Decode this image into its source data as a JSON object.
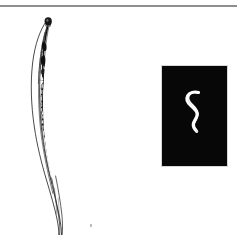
{
  "figure": {
    "title": "Nematode figure plate",
    "background_color": "#ffffff",
    "rule_color": "#8e8e8e",
    "panels": [
      {
        "id": "line-drawing",
        "kind": "line-drawing",
        "subject": "nematode whole mount, lateral view",
        "description": "Ink line drawing of an elongate nematode with a rounded darkened head bulb at the top, a broad mid-body containing stippled internal organs (pharynx, intestine, gonad), and a long tapering tail curving to the right",
        "ink_color": "#1a1a1a",
        "fill_color": "#ffffff",
        "orientation": "vertical",
        "head_position": "top",
        "tail_position": "bottom"
      },
      {
        "id": "darkfield-photo",
        "kind": "photomicrograph",
        "subject": "nematode, dark-field illumination",
        "description": "Small bright white S-shaped worm on a black background; the anterior end hooks to the left at the top and the body curves down and to the right",
        "background_color": "#070707",
        "specimen_color": "#ffffff",
        "border_color": "#d8d8d8"
      }
    ],
    "marks": [
      {
        "id": "bottom-speck",
        "type": "dust-speck",
        "color": "#bdbdbd"
      }
    ]
  }
}
